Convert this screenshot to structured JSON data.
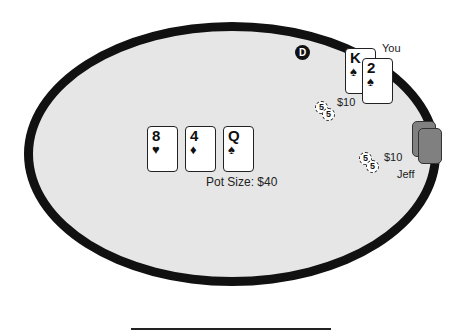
{
  "table": {
    "dealer_button": "D",
    "pot_label": "Pot Size: $40",
    "community_cards": [
      {
        "rank": "8",
        "suit": "♥"
      },
      {
        "rank": "4",
        "suit": "♦"
      },
      {
        "rank": "Q",
        "suit": "♠"
      }
    ]
  },
  "players": {
    "you": {
      "name": "You",
      "cards": [
        {
          "rank": "K",
          "suit": "♠"
        },
        {
          "rank": "2",
          "suit": "♠"
        }
      ],
      "bet": "$10",
      "chips": [
        "5",
        "5"
      ]
    },
    "jeff": {
      "name": "Jeff",
      "cards_face_down": 2,
      "bet": "$10",
      "chips": [
        "5",
        "5"
      ]
    }
  },
  "colors": {
    "felt": "#e6e6e6",
    "rail": "#111111",
    "card_back": "#808080"
  }
}
